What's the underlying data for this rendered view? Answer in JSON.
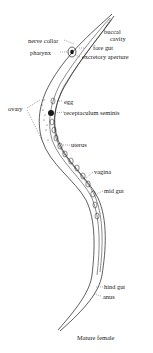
{
  "figure": {
    "caption": "Mature female",
    "labels": {
      "buccal_cavity_line1": "buccal",
      "buccal_cavity_line2": "cavity",
      "nerve_collar": "nerve collar",
      "pharynx": "pharynx",
      "fore_gut": "fore gut",
      "excretory_aperture": "excretory aperture",
      "egg": "egg",
      "ovary": "ovary",
      "receptaculum_seminis": "receptaculum seminis",
      "uterus": "uterus",
      "vagina": "vagina",
      "mid_gut": "mid gut",
      "hind_gut": "hind gut",
      "anus": "anus"
    },
    "colors": {
      "ink": "#1a1a1a",
      "background": "#ffffff"
    }
  }
}
